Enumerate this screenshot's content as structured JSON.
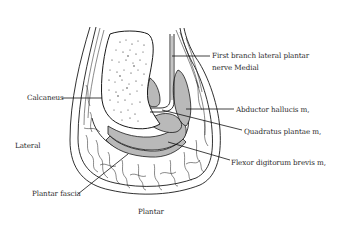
{
  "figure": {
    "type": "anatomical cross-section line drawing",
    "colors": {
      "line": "#1a1a1a",
      "muscle_fill": "#b9b9b9",
      "background": "#ffffff",
      "text": "#2a2a2a"
    }
  },
  "labels": {
    "nerve_line1": "First branch lateral plantar",
    "nerve_line2": "nerve Medial",
    "calcaneus": "Calcaneus",
    "abductor": "Abductor hallucis m,",
    "quadratus": "Quadratus plantae m,",
    "lateral": "Lateral",
    "flexor": "Flexor digitorum brevis m,",
    "plantar_fascia": "Plantar fascia",
    "plantar": "Plantar"
  }
}
